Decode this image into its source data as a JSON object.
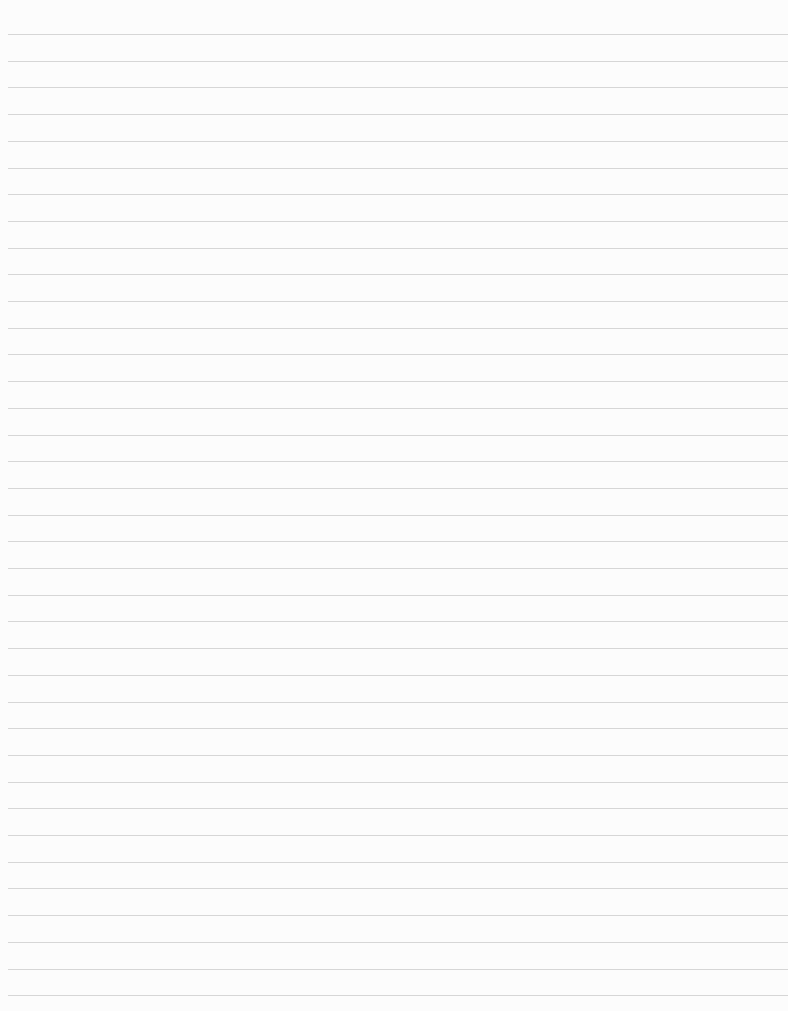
{
  "page": {
    "type": "lined-paper",
    "background_color": "#fcfcfc",
    "line_color": "#d6d6d6",
    "first_line_y": 34,
    "line_spacing": 26.7,
    "line_count": 37,
    "line_left": 8
  }
}
